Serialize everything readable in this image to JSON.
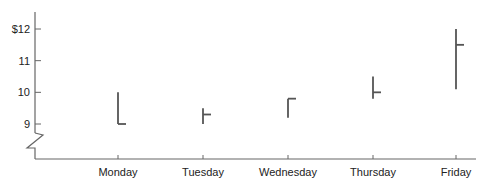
{
  "chart_data": {
    "type": "high-low-close",
    "title": "",
    "xlabel": "",
    "ylabel": "",
    "categories": [
      "Monday",
      "Tuesday",
      "Wednesday",
      "Thursday",
      "Friday"
    ],
    "series": [
      {
        "name": "High",
        "values": [
          10.0,
          9.5,
          9.8,
          10.5,
          12.0
        ]
      },
      {
        "name": "Low",
        "values": [
          9.0,
          9.0,
          9.2,
          9.8,
          10.1
        ]
      },
      {
        "name": "Close",
        "values": [
          9.0,
          9.3,
          9.8,
          10.0,
          11.5
        ]
      }
    ],
    "y_ticks": [
      "$12",
      "11",
      "10",
      "9"
    ],
    "ylim": [
      8,
      12.5
    ],
    "axis_break": true,
    "grid": false,
    "legend": "none"
  },
  "colors": {
    "line": "#555555",
    "axis": "#666666",
    "text": "#222222"
  }
}
